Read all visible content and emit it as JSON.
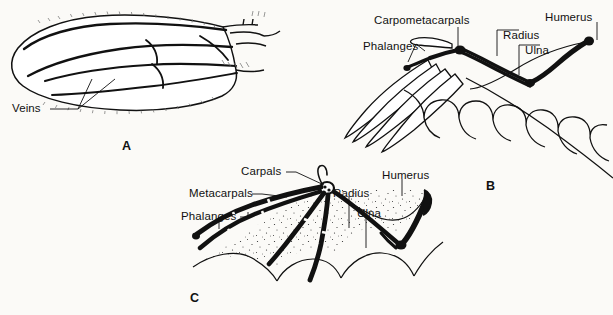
{
  "figure": {
    "background_color": "#fbfaf7",
    "ink_color": "#111111"
  },
  "panels": [
    {
      "letter": "A",
      "subject": "insect-wing",
      "labels": [
        {
          "text": "Veins",
          "x": 12,
          "y": 103
        }
      ]
    },
    {
      "letter": "B",
      "subject": "bird-wing",
      "labels": [
        {
          "text": "Carpometacarpals",
          "x": 374,
          "y": 15
        },
        {
          "text": "Phalanges",
          "x": 363,
          "y": 41
        },
        {
          "text": "Radius",
          "x": 503,
          "y": 30
        },
        {
          "text": "Ulna",
          "x": 525,
          "y": 45
        },
        {
          "text": "Humerus",
          "x": 545,
          "y": 12
        }
      ]
    },
    {
      "letter": "C",
      "subject": "bat-wing",
      "labels": [
        {
          "text": "Carpals",
          "x": 241,
          "y": 166
        },
        {
          "text": "Metacarpals",
          "x": 189,
          "y": 188
        },
        {
          "text": "Phalanges",
          "x": 181,
          "y": 211
        },
        {
          "text": "Radius",
          "x": 333,
          "y": 188
        },
        {
          "text": "Ulna",
          "x": 357,
          "y": 208
        },
        {
          "text": "Humerus",
          "x": 382,
          "y": 170
        }
      ]
    }
  ],
  "panel_letters": [
    {
      "text": "A",
      "x": 122,
      "y": 140
    },
    {
      "text": "B",
      "x": 486,
      "y": 180
    },
    {
      "text": "C",
      "x": 190,
      "y": 292
    }
  ]
}
